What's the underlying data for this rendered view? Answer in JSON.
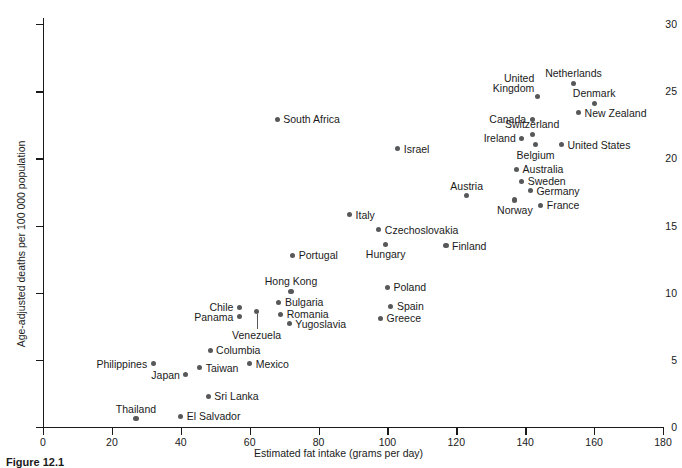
{
  "figure": {
    "caption": "Figure 12.1"
  },
  "chart_data": {
    "type": "scatter",
    "title": "",
    "xlabel": "Estimated fat intake (grams per day)",
    "ylabel": "Age-adjusted deaths per 100 000 population",
    "xlim": [
      0,
      180
    ],
    "ylim": [
      0,
      31
    ],
    "xticks": [
      0,
      20,
      40,
      60,
      80,
      100,
      120,
      140,
      160,
      180
    ],
    "yticks": [
      0,
      5,
      10,
      15,
      20,
      25,
      30
    ],
    "grid": false,
    "legend": "none",
    "marker_color": "#57585a",
    "points": [
      {
        "label": "Netherlands",
        "x": 154.0,
        "y": 25.6,
        "pos": "above"
      },
      {
        "label": "United\nKingdom",
        "x": 143.5,
        "y": 24.6,
        "pos": "left2"
      },
      {
        "label": "Denmark",
        "x": 160.0,
        "y": 24.1,
        "pos": "above"
      },
      {
        "label": "Canada",
        "x": 142.0,
        "y": 22.9,
        "pos": "left"
      },
      {
        "label": "New Zealand",
        "x": 155.5,
        "y": 23.4,
        "pos": "right"
      },
      {
        "label": "South Africa",
        "x": 68.0,
        "y": 22.9,
        "pos": "right"
      },
      {
        "label": "Switzerland",
        "x": 142.0,
        "y": 21.8,
        "pos": "above"
      },
      {
        "label": "Ireland",
        "x": 139.0,
        "y": 21.5,
        "pos": "left"
      },
      {
        "label": "Belgium",
        "x": 143.0,
        "y": 21.0,
        "pos": "below"
      },
      {
        "label": "United States",
        "x": 150.5,
        "y": 21.0,
        "pos": "right"
      },
      {
        "label": "Israel",
        "x": 103.0,
        "y": 20.7,
        "pos": "right"
      },
      {
        "label": "Australia",
        "x": 137.5,
        "y": 19.2,
        "pos": "right"
      },
      {
        "label": "Sweden",
        "x": 139.0,
        "y": 18.3,
        "pos": "right"
      },
      {
        "label": "Germany",
        "x": 141.5,
        "y": 17.6,
        "pos": "right"
      },
      {
        "label": "Austria",
        "x": 123.0,
        "y": 17.2,
        "pos": "above"
      },
      {
        "label": "Norway",
        "x": 137.0,
        "y": 16.9,
        "pos": "below"
      },
      {
        "label": "France",
        "x": 144.5,
        "y": 16.5,
        "pos": "right"
      },
      {
        "label": "Italy",
        "x": 89.0,
        "y": 15.8,
        "pos": "right"
      },
      {
        "label": "Czechoslovakia",
        "x": 97.5,
        "y": 14.7,
        "pos": "right"
      },
      {
        "label": "Hungary",
        "x": 99.5,
        "y": 13.6,
        "pos": "below"
      },
      {
        "label": "Finland",
        "x": 117.0,
        "y": 13.5,
        "pos": "right"
      },
      {
        "label": "Portugal",
        "x": 72.5,
        "y": 12.8,
        "pos": "right"
      },
      {
        "label": "Poland",
        "x": 100.0,
        "y": 10.4,
        "pos": "right"
      },
      {
        "label": "Hong Kong",
        "x": 72.0,
        "y": 10.1,
        "pos": "above"
      },
      {
        "label": "Bulgaria",
        "x": 68.5,
        "y": 9.3,
        "pos": "right"
      },
      {
        "label": "Spain",
        "x": 101.0,
        "y": 9.0,
        "pos": "right"
      },
      {
        "label": "Chile",
        "x": 57.0,
        "y": 8.9,
        "pos": "left"
      },
      {
        "label": "Venezuela",
        "x": 62.0,
        "y": 8.6,
        "pos": "leader"
      },
      {
        "label": "Romania",
        "x": 69.0,
        "y": 8.4,
        "pos": "right"
      },
      {
        "label": "Panama",
        "x": 57.0,
        "y": 8.2,
        "pos": "left"
      },
      {
        "label": "Greece",
        "x": 98.0,
        "y": 8.1,
        "pos": "right"
      },
      {
        "label": "Yugoslavia",
        "x": 71.5,
        "y": 7.7,
        "pos": "right"
      },
      {
        "label": "Columbia",
        "x": 48.5,
        "y": 5.7,
        "pos": "right"
      },
      {
        "label": "Mexico",
        "x": 60.0,
        "y": 4.7,
        "pos": "right"
      },
      {
        "label": "Philippines",
        "x": 32.0,
        "y": 4.7,
        "pos": "left"
      },
      {
        "label": "Taiwan",
        "x": 45.5,
        "y": 4.4,
        "pos": "right"
      },
      {
        "label": "Japan",
        "x": 41.5,
        "y": 3.9,
        "pos": "left"
      },
      {
        "label": "Sri Lanka",
        "x": 48.0,
        "y": 2.3,
        "pos": "right"
      },
      {
        "label": "El Salvador",
        "x": 40.0,
        "y": 0.8,
        "pos": "right"
      },
      {
        "label": "Thailand",
        "x": 27.0,
        "y": 0.6,
        "pos": "above"
      }
    ]
  }
}
